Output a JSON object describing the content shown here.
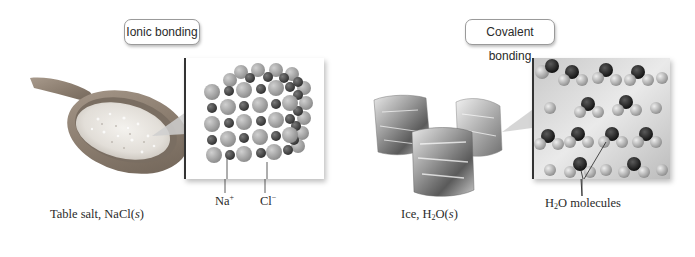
{
  "ionic": {
    "label": "Ionic bonding",
    "caption_prefix": "Table salt, NaCl(",
    "caption_state": "s",
    "caption_suffix": ")",
    "ion_labels": {
      "cation_symbol": "Na",
      "cation_charge": "+",
      "anion_symbol": "Cl",
      "anion_charge": "−"
    },
    "images": {
      "macro": "salt-spoon-image",
      "micro": "nacl-crystal-lattice"
    }
  },
  "covalent": {
    "label": "Covalent bonding",
    "caption_prefix": "Ice, H",
    "caption_sub": "2",
    "caption_mid": "O(",
    "caption_state": "s",
    "caption_suffix": ")",
    "molecule_label_prefix": "H",
    "molecule_label_sub": "2",
    "molecule_label_suffix": "O molecules",
    "images": {
      "macro": "ice-cubes-image",
      "micro": "water-molecule-lattice"
    }
  },
  "colors": {
    "large_ion": "#a9a9a9",
    "small_ion": "#4a4a4a",
    "oxygen": "#1a1a1a",
    "hydrogen": "#b8b8b8",
    "text": "#2a2a2a"
  }
}
